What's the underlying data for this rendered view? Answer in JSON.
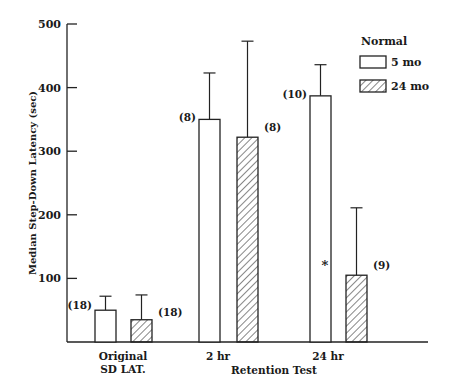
{
  "chart_data": {
    "type": "bar",
    "title": "",
    "xlabel": "Retention Test",
    "ylabel": "Median Step-Down Latency (sec)",
    "ylim": [
      0,
      500
    ],
    "yticks": [
      100,
      200,
      300,
      400,
      500
    ],
    "grid": false,
    "legend_position": "top-right",
    "legend_title": "Normal",
    "categories": [
      "Original SD LAT.",
      "2 hr",
      "24 hr"
    ],
    "category_lines": [
      [
        "Original",
        "SD LAT."
      ],
      [
        "2 hr"
      ],
      [
        "24 hr"
      ]
    ],
    "series": [
      {
        "name": "5 mo",
        "pattern": "open",
        "values": [
          50,
          350,
          387
        ],
        "error_upper": [
          72,
          423,
          436
        ],
        "n_labels": [
          "(18)",
          "(8)",
          "(10)"
        ]
      },
      {
        "name": "24 mo",
        "pattern": "hatched",
        "values": [
          35,
          322,
          105
        ],
        "error_upper": [
          74,
          473,
          211
        ],
        "n_labels": [
          "(18)",
          "(8)",
          "(9)"
        ]
      }
    ],
    "annotations": [
      {
        "text": "*",
        "category": "24 hr",
        "series": "24 mo",
        "meaning": "significant difference"
      }
    ]
  },
  "legend": {
    "title": "Normal",
    "items": [
      "5 mo",
      "24 mo"
    ]
  },
  "axis": {
    "ylabel": "Median Step-Down Latency (sec)",
    "xlabel": "Retention Test",
    "ticks": [
      "100",
      "200",
      "300",
      "400",
      "500"
    ]
  }
}
